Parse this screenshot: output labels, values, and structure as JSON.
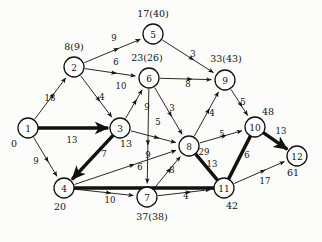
{
  "diagram": {
    "style": {
      "stroke": "#111111",
      "fill": "#ffffff",
      "background": "#fcfcfa",
      "thick_width": 3.4,
      "thin_width": 0.9
    },
    "nodes": [
      {
        "id": "1",
        "label": "1",
        "x": 28,
        "y": 128,
        "r": 10,
        "cost": "0",
        "cost_x": 14,
        "cost_y": 147
      },
      {
        "id": "2",
        "label": "2",
        "x": 74,
        "y": 67,
        "r": 10,
        "cost": "8(9)",
        "cost_x": 74,
        "cost_y": 50
      },
      {
        "id": "3",
        "label": "3",
        "x": 120,
        "y": 128,
        "r": 10,
        "cost": "13",
        "cost_x": 126,
        "cost_y": 147
      },
      {
        "id": "4",
        "label": "4",
        "x": 64,
        "y": 188,
        "r": 10,
        "cost": "20",
        "cost_x": 60,
        "cost_y": 210
      },
      {
        "id": "5",
        "label": "5",
        "x": 153,
        "y": 34,
        "r": 10,
        "cost": "17(40)",
        "cost_x": 153,
        "cost_y": 17
      },
      {
        "id": "6",
        "label": "6",
        "x": 149,
        "y": 78,
        "r": 10,
        "cost": "23(26)",
        "cost_x": 147,
        "cost_y": 61
      },
      {
        "id": "7",
        "label": "7",
        "x": 147,
        "y": 197,
        "r": 10,
        "cost": "37(38)",
        "cost_x": 152,
        "cost_y": 220
      },
      {
        "id": "8",
        "label": "8",
        "x": 189,
        "y": 146,
        "r": 10,
        "cost": "",
        "cost_x": 189,
        "cost_y": 146
      },
      {
        "id": "9",
        "label": "9",
        "x": 225,
        "y": 80,
        "r": 10,
        "cost": "33(43)",
        "cost_x": 226,
        "cost_y": 62
      },
      {
        "id": "10",
        "label": "10",
        "x": 255,
        "y": 127,
        "r": 10,
        "cost": "48",
        "cost_x": 268,
        "cost_y": 115
      },
      {
        "id": "11",
        "label": "11",
        "x": 224,
        "y": 188,
        "r": 10,
        "cost": "42",
        "cost_x": 232,
        "cost_y": 209
      },
      {
        "id": "12",
        "label": "12",
        "x": 297,
        "y": 156,
        "r": 10,
        "cost": "61",
        "cost_x": 293,
        "cost_y": 176
      }
    ],
    "edges": [
      {
        "from": "1",
        "to": "2",
        "weight": "18",
        "lx": 50,
        "ly": 101,
        "thick": false,
        "arrow": true
      },
      {
        "from": "1",
        "to": "3",
        "weight": "13",
        "lx": 72,
        "ly": 143,
        "thick": true,
        "arrow": true
      },
      {
        "from": "1",
        "to": "4",
        "weight": "9",
        "lx": 36,
        "ly": 164,
        "thick": false,
        "arrow": true
      },
      {
        "from": "2",
        "to": "5",
        "weight": "9",
        "lx": 114,
        "ly": 41,
        "thick": false,
        "arrow": true
      },
      {
        "from": "2",
        "to": "6",
        "weight": "6",
        "lx": 116,
        "ly": 65,
        "thick": false,
        "arrow": true
      },
      {
        "from": "2",
        "to": "3",
        "weight": "4",
        "lx": 102,
        "ly": 100,
        "thick": false,
        "arrow": true
      },
      {
        "from": "3",
        "to": "6",
        "weight": "10",
        "lx": 121,
        "ly": 89,
        "thick": false,
        "arrow": true
      },
      {
        "from": "3",
        "to": "8",
        "weight": "9",
        "lx": 147,
        "ly": 110,
        "thick": false,
        "arrow": true
      },
      {
        "from": "3",
        "to": "4",
        "weight": "7",
        "lx": 104,
        "ly": 157,
        "thick": true,
        "arrow": true
      },
      {
        "from": "5",
        "to": "9",
        "weight": "3",
        "lx": 193,
        "ly": 57,
        "thick": false,
        "arrow": true
      },
      {
        "from": "6",
        "to": "9",
        "weight": "8",
        "lx": 188,
        "ly": 87,
        "thick": false,
        "arrow": true
      },
      {
        "from": "6",
        "to": "8",
        "weight": "3",
        "lx": 172,
        "ly": 111,
        "thick": false,
        "arrow": true
      },
      {
        "from": "6",
        "to": "7",
        "weight": "5",
        "lx": 158,
        "ly": 125,
        "thick": false,
        "arrow": true
      },
      {
        "from": "4",
        "to": "8",
        "weight": "6",
        "lx": 140,
        "ly": 170,
        "thick": false,
        "arrow": true
      },
      {
        "from": "4",
        "to": "11",
        "weight": "9",
        "lx": 148,
        "ly": 158,
        "thick": true,
        "arrow": false
      },
      {
        "from": "4",
        "to": "7",
        "weight": "10",
        "lx": 110,
        "ly": 203,
        "thick": false,
        "arrow": true
      },
      {
        "from": "7",
        "to": "8",
        "weight": "8",
        "lx": 172,
        "ly": 173,
        "thick": false,
        "arrow": true
      },
      {
        "from": "7",
        "to": "11",
        "weight": "4",
        "lx": 186,
        "ly": 199,
        "thick": false,
        "arrow": true
      },
      {
        "from": "8",
        "to": "9",
        "weight": "4",
        "lx": 212,
        "ly": 116,
        "thick": false,
        "arrow": true
      },
      {
        "from": "8",
        "to": "10",
        "weight": "5",
        "lx": 222,
        "ly": 137,
        "thick": false,
        "arrow": true
      },
      {
        "from": "8",
        "to": "11",
        "weight": "13",
        "lx": 212,
        "ly": 167,
        "thick": true,
        "arrow": false
      },
      {
        "from": "9",
        "to": "10",
        "weight": "5",
        "lx": 243,
        "ly": 105,
        "thick": false,
        "arrow": true
      },
      {
        "from": "10",
        "to": "11",
        "weight": "6",
        "lx": 247,
        "ly": 158,
        "thick": true,
        "arrow": false
      },
      {
        "from": "10",
        "to": "12",
        "weight": "13",
        "lx": 281,
        "ly": 134,
        "thick": true,
        "arrow": true
      },
      {
        "from": "11",
        "to": "12",
        "weight": "17",
        "lx": 265,
        "ly": 184,
        "thick": false,
        "arrow": true
      }
    ],
    "extra_labels": [
      {
        "text": "29",
        "x": 204,
        "y": 155
      }
    ]
  }
}
